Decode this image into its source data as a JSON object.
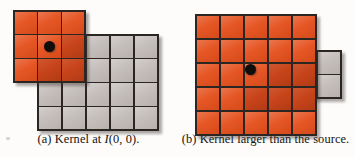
{
  "figure": {
    "background_color": "#fdfcfb",
    "colors": {
      "kernel_orange": "#e5511e",
      "kernel_orange_overlap": "#c8441a",
      "source_gray": "#c2bcb9",
      "grid_line": "#2b2622",
      "anchor_dot": "#100d0b"
    }
  },
  "panels": [
    {
      "id": "a",
      "label": "(a)",
      "caption_prefix": "(a) Kernel at ",
      "caption_math": "I",
      "caption_suffix": "(0, 0).",
      "caption_full": "(a) Kernel at I(0, 0).",
      "source_grid": {
        "name": "source-image-grid",
        "cols": 5,
        "rows": 4,
        "fill": "#c2bcb9"
      },
      "kernel_grid": {
        "name": "kernel-grid",
        "cols": 3,
        "rows": 3,
        "fill": "#e5511e",
        "offset_cols": -1,
        "offset_rows": -1
      },
      "anchor": {
        "name": "kernel-anchor-dot",
        "kernel_col": 1,
        "kernel_row": 1,
        "source_coord": "I(0,0)"
      }
    },
    {
      "id": "b",
      "label": "(b)",
      "caption_prefix": "(b) Kernel larger than the source.",
      "caption_math": "",
      "caption_suffix": "",
      "caption_full": "(b) Kernel larger than the source.",
      "source_grid": {
        "name": "source-image-grid",
        "cols": 2,
        "rows": 2,
        "fill": "#c2bcb9"
      },
      "kernel_grid": {
        "name": "kernel-grid",
        "cols": 5,
        "rows": 5,
        "fill": "#e5511e",
        "overlap_cols": 2,
        "overlap_rows": 2,
        "overlap_fill": "#c8441a"
      },
      "anchor": {
        "name": "kernel-anchor-dot",
        "kernel_col": 2,
        "kernel_row": 2,
        "source_coord": "I(0,0)"
      }
    }
  ]
}
